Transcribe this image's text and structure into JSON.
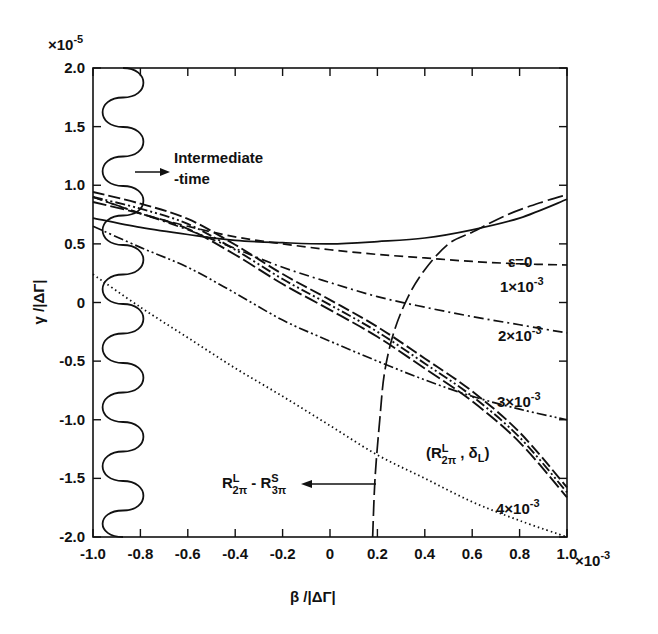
{
  "chart_data": {
    "type": "line",
    "title": "",
    "xlabel": "β /|ΔΓ|",
    "ylabel": "γ /|ΔΓ|",
    "x_multiplier": "×10-3",
    "y_multiplier": "×10-5",
    "xlim": [
      -1.0,
      1.0
    ],
    "ylim": [
      -2.0,
      2.0
    ],
    "x_ticks": [
      "-1.0",
      "-0.8",
      "-0.6",
      "-0.4",
      "-0.2",
      "0",
      "0.2",
      "0.4",
      "0.6",
      "0.8",
      "1.0"
    ],
    "y_ticks": [
      "2.0",
      "1.5",
      "1.0",
      "0.5",
      "0",
      "-0.5",
      "-1.0",
      "-1.5",
      "-2.0"
    ],
    "grid": false,
    "series": [
      {
        "name": "ε=0",
        "style": "solid",
        "x": [
          -1.0,
          -0.8,
          -0.6,
          -0.4,
          -0.2,
          0,
          0.2,
          0.4,
          0.6,
          0.8,
          1.0
        ],
        "y": [
          0.72,
          0.64,
          0.58,
          0.53,
          0.51,
          0.5,
          0.52,
          0.55,
          0.62,
          0.72,
          0.88
        ]
      },
      {
        "name": "1×10-3",
        "style": "dashed",
        "x": [
          -1.0,
          -0.8,
          -0.6,
          -0.4,
          -0.2,
          0,
          0.2,
          0.4,
          0.6,
          0.8,
          1.0
        ],
        "y": [
          0.9,
          0.76,
          0.65,
          0.56,
          0.5,
          0.45,
          0.41,
          0.38,
          0.35,
          0.33,
          0.32
        ]
      },
      {
        "name": "2×10-3",
        "style": "dash-dot",
        "x": [
          -1.0,
          -0.8,
          -0.6,
          -0.4,
          -0.2,
          0,
          0.2,
          0.4,
          0.6,
          0.8,
          1.0
        ],
        "y": [
          0.9,
          0.76,
          0.62,
          0.46,
          0.3,
          0.17,
          0.05,
          -0.04,
          -0.12,
          -0.19,
          -0.26
        ]
      },
      {
        "name": "3×10-3",
        "style": "dash-dot-dot",
        "x": [
          -1.0,
          -0.8,
          -0.6,
          -0.4,
          -0.2,
          0,
          0.2,
          0.4,
          0.6,
          0.8,
          1.0
        ],
        "y": [
          0.65,
          0.47,
          0.3,
          0.08,
          -0.15,
          -0.33,
          -0.5,
          -0.66,
          -0.8,
          -0.91,
          -1.0
        ]
      },
      {
        "name": "4×10-3",
        "style": "dotted",
        "x": [
          -1.0,
          -0.8,
          -0.6,
          -0.4,
          -0.2,
          0,
          0.2,
          0.4,
          0.6,
          0.8,
          1.0
        ],
        "y": [
          0.24,
          -0.04,
          -0.3,
          -0.56,
          -0.8,
          -1.05,
          -1.3,
          -1.5,
          -1.7,
          -1.86,
          -2.0
        ]
      },
      {
        "name": "(R2πL, δL)",
        "style": "triple long-dash bundle",
        "x": [
          -1.0,
          -0.8,
          -0.6,
          -0.4,
          -0.2,
          0,
          0.2,
          0.4,
          0.6,
          0.8,
          1.0
        ],
        "y": [
          0.9,
          0.8,
          0.67,
          0.45,
          0.2,
          -0.02,
          -0.25,
          -0.52,
          -0.8,
          -1.15,
          -1.62
        ]
      },
      {
        "name": "R2πL - R3πS",
        "style": "long-dash",
        "x": [
          0.18,
          0.19,
          0.21,
          0.23,
          0.27,
          0.33,
          0.4,
          0.5,
          0.6,
          0.75,
          0.9,
          1.0
        ],
        "y": [
          -2.0,
          -1.5,
          -1.0,
          -0.6,
          -0.25,
          0.05,
          0.28,
          0.5,
          0.6,
          0.75,
          0.86,
          0.92
        ]
      }
    ],
    "annotations": [
      "Intermediate -time",
      "ε=0",
      "1×10-3",
      "2×10-3",
      "3×10-3",
      "4×10-3",
      "(R2πL , δL)",
      "R2πL - R3πS"
    ]
  },
  "labels": {
    "y_mult_base": "×10",
    "y_mult_exp": "-5",
    "x_mult_base": "×10",
    "x_mult_exp": "-3",
    "xlabel": "β /|ΔΓ|",
    "ylabel": "γ /|ΔΓ|",
    "intermediate_1": "Intermediate",
    "intermediate_2": "-time",
    "eps0": "ε=0",
    "eps1_base": "1×10",
    "eps2_base": "2×10",
    "eps3_base": "3×10",
    "eps4_base": "4×10",
    "eps_exp": "-3"
  }
}
